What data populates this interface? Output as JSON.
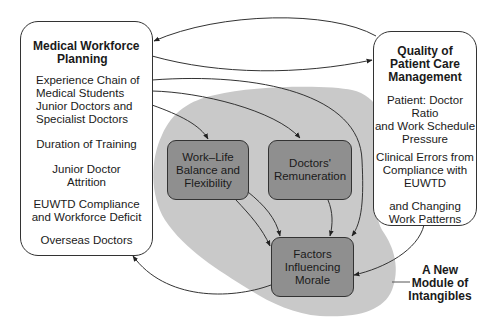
{
  "diagram": {
    "colors": {
      "blob": "#c9c9c9",
      "inner_box": "#8f8f8f",
      "line": "#333333"
    },
    "left_box": {
      "title": [
        "Medical Workforce",
        "Planning"
      ],
      "items": [
        [
          "Experience Chain of",
          "Medical Students",
          "Junior Doctors and",
          "Specialist Doctors"
        ],
        [
          "Duration of Training"
        ],
        [
          "Junior Doctor",
          "Attrition"
        ],
        [
          "EUWTD Compliance",
          "and Workforce Deficit"
        ],
        [
          "Overseas Doctors"
        ]
      ]
    },
    "right_box": {
      "title": [
        "Quality of",
        "Patient Care",
        "Management"
      ],
      "items": [
        [
          "Patient: Doctor Ratio",
          "and Work Schedule",
          "Pressure"
        ],
        [
          "Clinical Errors from",
          "Compliance with",
          "EUWTD"
        ],
        [
          "and Changing",
          "Work Patterns"
        ]
      ]
    },
    "inner_nodes": {
      "work_life": [
        "Work–Life",
        "Balance and",
        "Flexibility"
      ],
      "remuneration": [
        "Doctors'",
        "Remuneration"
      ],
      "morale": [
        "Factors",
        "Influencing",
        "Morale"
      ]
    },
    "module_label": [
      "A New",
      "Module of",
      "Intangibles"
    ]
  }
}
